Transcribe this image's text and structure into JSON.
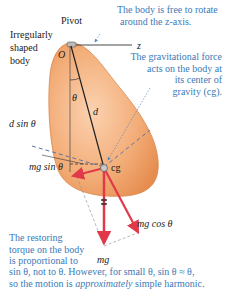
{
  "figure": {
    "labels": {
      "pivot": "Pivot",
      "body_desc": [
        "Irregularly",
        "shaped",
        "body"
      ],
      "origin": "O",
      "z_axis": "z",
      "theta": "θ",
      "distance": "d",
      "d_sin_theta": "d sin θ",
      "mg_sin_theta": "mg sin θ",
      "cg": "cg",
      "mg_cos_theta": "mg cos θ",
      "mg": "mg"
    },
    "notes": {
      "rotation": [
        "The body is free to rotate",
        "around the z-axis."
      ],
      "gravity": [
        "The gravitational force",
        "acts on the body at",
        "its center of",
        "gravity (cg)."
      ],
      "restoring_short": [
        "The restoring",
        "torque on the body",
        "is proportional to"
      ],
      "restoring_long_1": "sin θ, not to θ. However, for small θ, sin θ ≈ θ,",
      "restoring_long_2_pre": "so the motion is ",
      "restoring_long_2_em": "approximately",
      "restoring_long_2_post": " simple harmonic."
    },
    "colors": {
      "body_fill": "#f0a46c",
      "body_edge": "#d9854a",
      "force_red": "#e2394a",
      "annotation_blue": "#3a7ab8"
    }
  }
}
